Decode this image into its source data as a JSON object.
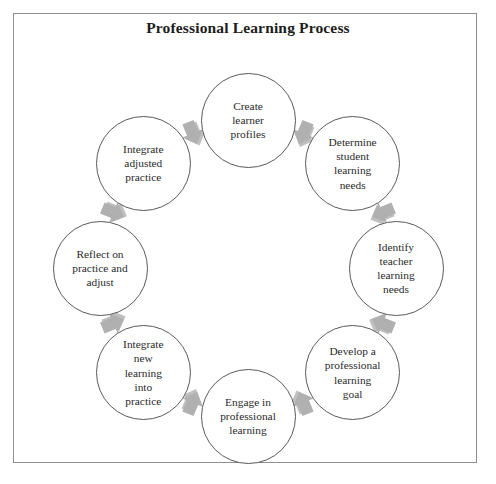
{
  "document": {
    "title": "Professional Learning Process",
    "frame_color": "#8e8e8e",
    "background_color": "#ffffff"
  },
  "diagram": {
    "type": "cycle",
    "direction": "clockwise",
    "node_count": 8,
    "arrow_count": 8,
    "circle_outline_color": "#5a5a5a",
    "circle_fill_color": "#ffffff",
    "text_color": "#2b2b2b",
    "arrow_fill_color": "#b0b0b0",
    "arrow_shadow_color": "#8c8c8c",
    "center": {
      "x": 235,
      "y": 255
    },
    "ring_radius": 148,
    "arrow_radius": 147,
    "circle_diameter": 95,
    "nodes": [
      {
        "id": "create-learner-profiles",
        "label": "Create\nlearner\nprofiles",
        "order": 1,
        "angle_deg": -90
      },
      {
        "id": "determine-student-learning-needs",
        "label": "Determine\nstudent\nlearning\nneeds",
        "order": 2,
        "angle_deg": -45
      },
      {
        "id": "identify-teacher-learning-needs",
        "label": "Identify\nteacher\nlearning\nneeds",
        "order": 3,
        "angle_deg": 0
      },
      {
        "id": "develop-a-professional-learning-goal",
        "label": "Develop a\nprofessional\nlearning\ngoal",
        "order": 4,
        "angle_deg": 45
      },
      {
        "id": "engage-in-professional-learning",
        "label": "Engage in\nprofessional\nlearning",
        "order": 5,
        "angle_deg": 90
      },
      {
        "id": "integrate-new-learning-into-practice",
        "label": "Integrate\nnew\nlearning\ninto\npractice",
        "order": 6,
        "angle_deg": 135
      },
      {
        "id": "reflect-on-practice-and-adjust",
        "label": "Reflect on\npractice and\nadjust",
        "order": 7,
        "angle_deg": 180
      },
      {
        "id": "integrate-adjusted-practice",
        "label": "Integrate\nadjusted\npractice",
        "order": 8,
        "angle_deg": -135
      }
    ],
    "arrows": [
      {
        "id": "arrow-1-to-2",
        "from": "create-learner-profiles",
        "to": "determine-student-learning-needs",
        "angle_deg": -67.5
      },
      {
        "id": "arrow-2-to-3",
        "from": "determine-student-learning-needs",
        "to": "identify-teacher-learning-needs",
        "angle_deg": -22.5
      },
      {
        "id": "arrow-3-to-4",
        "from": "identify-teacher-learning-needs",
        "to": "develop-a-professional-learning-goal",
        "angle_deg": 22.5
      },
      {
        "id": "arrow-4-to-5",
        "from": "develop-a-professional-learning-goal",
        "to": "engage-in-professional-learning",
        "angle_deg": 67.5
      },
      {
        "id": "arrow-5-to-6",
        "from": "engage-in-professional-learning",
        "to": "integrate-new-learning-into-practice",
        "angle_deg": 112.5
      },
      {
        "id": "arrow-6-to-7",
        "from": "integrate-new-learning-into-practice",
        "to": "reflect-on-practice-and-adjust",
        "angle_deg": 157.5
      },
      {
        "id": "arrow-7-to-8",
        "from": "reflect-on-practice-and-adjust",
        "to": "integrate-adjusted-practice",
        "angle_deg": 202.5
      },
      {
        "id": "arrow-8-to-1",
        "from": "integrate-adjusted-practice",
        "to": "create-learner-profiles",
        "angle_deg": 247.5
      }
    ]
  }
}
